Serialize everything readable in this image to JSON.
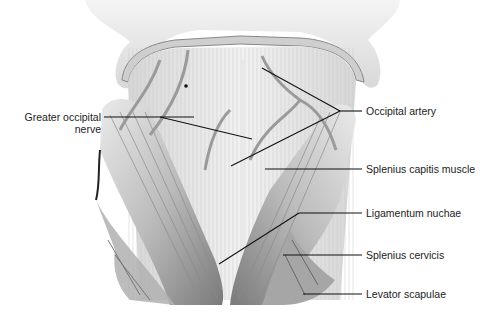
{
  "figure": {
    "labels": {
      "greater_occipital_nerve": {
        "line1": "Greater occipital",
        "line2": "nerve"
      },
      "occipital_artery": "Occipital artery",
      "splenius_capitis": "Splenius capitis muscle",
      "ligamentum_nuchae": "Ligamentum nuchae",
      "splenius_cervicis": "Splenius cervicis",
      "levator_scapulae": "Levator scapulae"
    },
    "colors": {
      "background": "#ffffff",
      "muscle_light": "#e6e6e6",
      "muscle_mid": "#b5b5b5",
      "muscle_dark": "#555555",
      "leader_line": "#111111",
      "text": "#222222"
    }
  }
}
